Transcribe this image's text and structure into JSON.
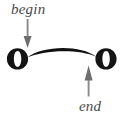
{
  "figure": {
    "background_color": "#ffffff"
  },
  "annotations": {
    "begin": {
      "label": "begin",
      "color": "#4a4a4a",
      "arrow_direction": "down",
      "points_to": "start of connecting stroke at left letter"
    },
    "end": {
      "label": "end",
      "color": "#4a4a4a",
      "arrow_direction": "up",
      "points_to": "end of connecting stroke at right letter"
    }
  },
  "glyphs": {
    "left_letter": "o",
    "right_letter": "o",
    "letter_color": "#141414"
  },
  "stroke": {
    "name": "connecting-arc",
    "color": "#111111",
    "description": "tapered arc rising between the two letters"
  },
  "arrows": {
    "shaft_color": "#8a8a8a",
    "head_color": "#6e6e6e"
  }
}
